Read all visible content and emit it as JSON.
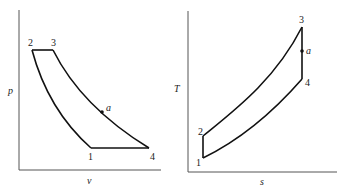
{
  "diagrams": [
    {
      "id": "pv",
      "title": "p-v diagram",
      "x_axis_label": "v",
      "y_axis_label": "p",
      "states": [
        {
          "label": "1"
        },
        {
          "label": "2"
        },
        {
          "label": "3"
        },
        {
          "label": "4"
        },
        {
          "label": "a"
        }
      ]
    },
    {
      "id": "ts",
      "title": "T-s diagram",
      "x_axis_label": "s",
      "y_axis_label": "T",
      "states": [
        {
          "label": "1"
        },
        {
          "label": "2"
        },
        {
          "label": "3"
        },
        {
          "label": "4"
        },
        {
          "label": "a"
        }
      ]
    }
  ],
  "colors": {
    "line": "#111111",
    "axis": "#555555",
    "background": "#ffffff"
  }
}
